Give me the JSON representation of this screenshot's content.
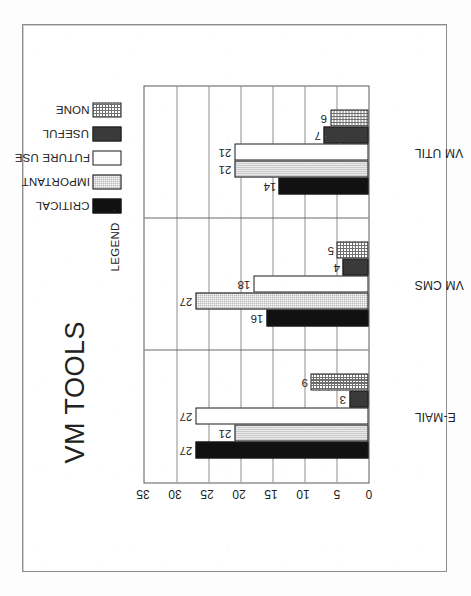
{
  "chart_data": {
    "type": "bar",
    "title": "VM TOOLS",
    "xlabel": "",
    "ylabel": "",
    "categories": [
      "E-MAIL",
      "VM CMS",
      "VM UTIL"
    ],
    "series": [
      {
        "name": "CRITICAL",
        "values": [
          27,
          16,
          14
        ],
        "fill": "solid-black",
        "color": "#111111"
      },
      {
        "name": "IMPORTANT",
        "values": [
          21,
          27,
          21
        ],
        "fill": "gray-dotted",
        "color": "#b9b9b9"
      },
      {
        "name": "FUTURE USE",
        "values": [
          27,
          18,
          21
        ],
        "fill": "white",
        "color": "#ffffff"
      },
      {
        "name": "USEFUL",
        "values": [
          3,
          4,
          7
        ],
        "fill": "dark-gray",
        "color": "#3a3a3a"
      },
      {
        "name": "NONE",
        "values": [
          9,
          5,
          6
        ],
        "fill": "crosshatch",
        "color": "#6f6f6f"
      }
    ],
    "ylim": [
      0,
      35
    ],
    "yticks": [
      0,
      5,
      10,
      15,
      20,
      25,
      30,
      35
    ],
    "grid": true,
    "legend_position": "top-right",
    "data_labels": true
  },
  "legend": {
    "title": "LEGEND",
    "items": [
      {
        "label": "CRITICAL"
      },
      {
        "label": "IMPORTANT"
      },
      {
        "label": "FUTURE USE"
      },
      {
        "label": "USEFUL"
      },
      {
        "label": "NONE"
      }
    ]
  }
}
